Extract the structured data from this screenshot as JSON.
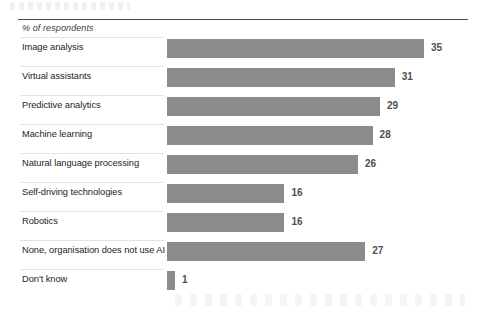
{
  "axis_note": "% of respondents",
  "colors": {
    "bar": "#8c8c8c",
    "value_text": "#4f4f4f",
    "label_text": "#1d1d1d",
    "top_rule": "#4a4a4a",
    "separator": "#e2e2e2",
    "background": "#ffffff"
  },
  "chart_data": {
    "type": "bar",
    "orientation": "horizontal",
    "title": "",
    "subtitle": "",
    "xlabel": "% of respondents",
    "ylabel": "",
    "xlim": [
      0,
      35
    ],
    "grid": false,
    "legend": false,
    "categories": [
      "Image analysis",
      "Virtual assistants",
      "Predictive analytics",
      "Machine learning",
      "Natural language processing",
      "Self-driving technologies",
      "Robotics",
      "None, organisation does not use AI",
      "Don't know"
    ],
    "values": [
      35,
      31,
      29,
      28,
      26,
      16,
      16,
      27,
      1
    ],
    "data_labels": [
      "35",
      "31",
      "29",
      "28",
      "26",
      "16",
      "16",
      "27",
      "1"
    ]
  }
}
